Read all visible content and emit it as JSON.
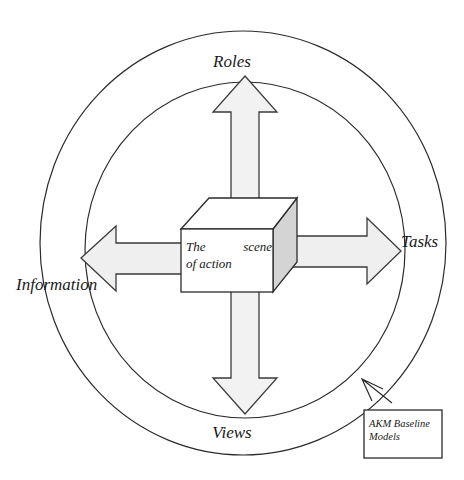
{
  "diagram": {
    "title": "The scene of action",
    "type": "concentric-circles-with-cross-arrows",
    "center_node": {
      "name": "scene-of-action-cube",
      "shape": "3d-cube",
      "text_line_1": "The    scene",
      "text_line_2": "of action",
      "front_fill": "#ffffff",
      "top_fill": "#ffffff",
      "side_fill": "#d4d4d4",
      "stroke": "#2b2b2b"
    },
    "rings": [
      {
        "name": "outer-ring",
        "label": "outer-circle",
        "stroke": "#2b2b2b",
        "fill": "none"
      },
      {
        "name": "inner-ring",
        "label": "inner-circle",
        "stroke": "#2b2b2b",
        "fill": "none"
      }
    ],
    "arrows": [
      {
        "name": "arrow-up",
        "direction": "up",
        "target_label": "Roles",
        "fill": "#f2f2f2",
        "stroke": "#3a3a3a"
      },
      {
        "name": "arrow-right",
        "direction": "right",
        "target_label": "Tasks",
        "fill": "#efefef",
        "stroke": "#3a3a3a"
      },
      {
        "name": "arrow-down",
        "direction": "down",
        "target_label": "Views",
        "fill": "#f2f2f2",
        "stroke": "#3a3a3a"
      },
      {
        "name": "arrow-left",
        "direction": "left",
        "target_label": "Information",
        "fill": "#efefef",
        "stroke": "#3a3a3a"
      }
    ],
    "labels": {
      "top": "Roles",
      "right": "Tasks",
      "bottom": "Views",
      "left": "Information"
    },
    "callout": {
      "name": "akm-baseline-models-note",
      "text_line_1": "AKM Baseline",
      "text_line_2": "Models",
      "pointer": "open-arrow-up-left",
      "box_fill": "#ffffff",
      "box_stroke": "#2b2b2b"
    },
    "colors": {
      "ink": "#2b2b2b",
      "paper": "#ffffff",
      "arrow_light": "#f2f2f2",
      "cube_shade": "#d4d4d4"
    }
  }
}
